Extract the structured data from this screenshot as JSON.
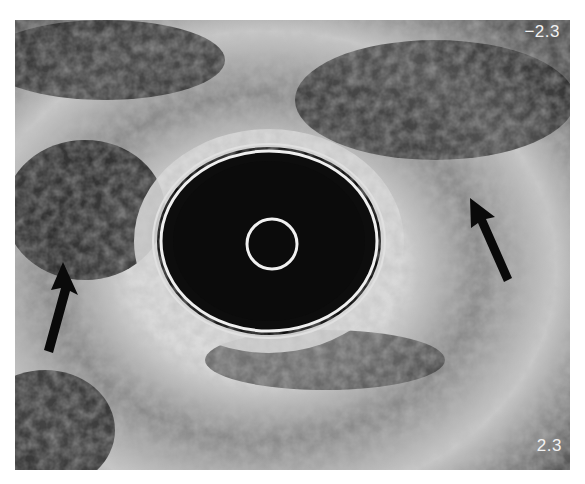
{
  "image": {
    "type": "endoscopic ultrasound cross-section",
    "colors": {
      "background": "#ffffff",
      "tissue_bright": "#e8e8e8",
      "tissue_dark": "#1a1a1a",
      "lumen": "#0d0d0d",
      "ring": "#efefef",
      "arrow": "#0a0a0a"
    }
  },
  "labels": {
    "depth_top": "−2.3",
    "depth_bottom": "2.3"
  },
  "arrows": [
    {
      "name": "left-arrow",
      "tip": [
        63,
        262
      ],
      "tail": [
        45,
        350
      ]
    },
    {
      "name": "right-arrow",
      "tip": [
        470,
        198
      ],
      "tail": [
        510,
        278
      ]
    }
  ]
}
